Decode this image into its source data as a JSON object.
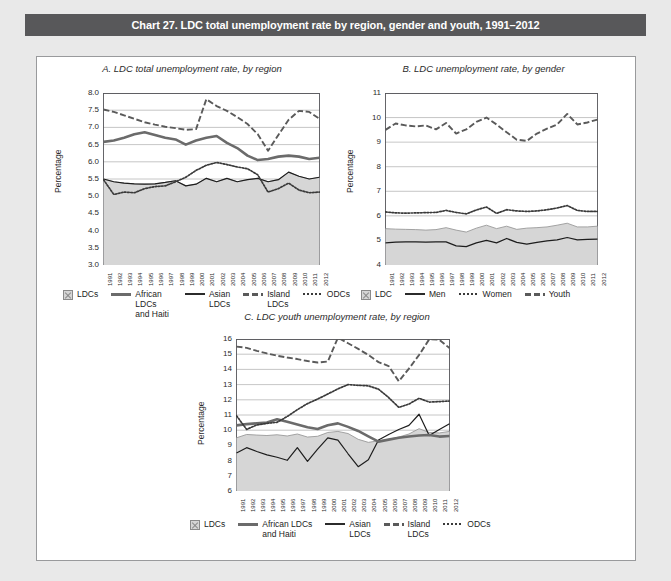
{
  "header": {
    "title": "Chart 27. LDC total unemployment rate by region, gender and youth, 1991–2012",
    "bar_color": "#58585a"
  },
  "page": {
    "background": "#e9e9e9",
    "frame_background": "#ffffff"
  },
  "colors": {
    "area_fill": "#d6d6d6",
    "area_edge": "#9a9a9a",
    "thick_line": "#6b6b6b",
    "thin_line": "#1d1d1d",
    "dashed_line": "#5a5a5a",
    "dotted_line": "#3a3a3a",
    "grid": "#b8b8b8",
    "axis": "#55565a"
  },
  "years": [
    "1991",
    "1992",
    "1993",
    "1994",
    "1995",
    "1996",
    "1997",
    "1998",
    "1999",
    "2000",
    "2001",
    "2002",
    "2003",
    "2004",
    "2005",
    "2006",
    "2007",
    "2008",
    "2009",
    "2010",
    "2011",
    "2012"
  ],
  "panelA": {
    "title": "A.  LDC total unemployment rate, by region",
    "ylabel": "Percentage",
    "yticks": [
      "8.0",
      "7.5",
      "7.0",
      "6.5",
      "6.0",
      "5.5",
      "5.0",
      "4.5",
      "4.0",
      "3.5",
      "3.0"
    ],
    "legend": [
      {
        "name": "LDCs",
        "style": "area"
      },
      {
        "name": "African LDCs and Haiti",
        "style": "thick"
      },
      {
        "name": "Asian LDCs",
        "style": "thin"
      },
      {
        "name": "Island LDCs",
        "style": "dash"
      },
      {
        "name": "ODCs",
        "style": "dot"
      }
    ]
  },
  "panelB": {
    "title": "B.  LDC unemployment rate, by gender",
    "ylabel": "Percentage",
    "yticks": [
      "11",
      "10",
      "9",
      "8",
      "7",
      "6",
      "5",
      "4"
    ],
    "legend": [
      {
        "name": "LDC",
        "style": "area"
      },
      {
        "name": "Men",
        "style": "thin"
      },
      {
        "name": "Women",
        "style": "dot"
      },
      {
        "name": "Youth",
        "style": "dash"
      }
    ]
  },
  "panelC": {
    "title": "C.  LDC youth unemployment rate, by region",
    "ylabel": "Percentage",
    "yticks": [
      "16",
      "15",
      "14",
      "13",
      "12",
      "11",
      "10",
      "9",
      "8",
      "7",
      "6"
    ],
    "legend": [
      {
        "name": "LDCs",
        "style": "area"
      },
      {
        "name": "African LDCs and Haiti",
        "style": "thick"
      },
      {
        "name": "Asian LDCs",
        "style": "thin"
      },
      {
        "name": "Island LDCs",
        "style": "dash"
      },
      {
        "name": "ODCs",
        "style": "dot"
      }
    ]
  },
  "chart_data": [
    {
      "type": "line",
      "panel": "A",
      "title": "A.  LDC total unemployment rate, by region",
      "xlabel": "",
      "ylabel": "Percentage",
      "ylim": [
        3.0,
        8.0
      ],
      "ytick_step": 0.5,
      "grid": true,
      "legend_position": "bottom",
      "x": [
        "1991",
        "1992",
        "1993",
        "1994",
        "1995",
        "1996",
        "1997",
        "1998",
        "1999",
        "2000",
        "2001",
        "2002",
        "2003",
        "2004",
        "2005",
        "2006",
        "2007",
        "2008",
        "2009",
        "2010",
        "2011",
        "2012"
      ],
      "series": [
        {
          "name": "LDCs",
          "style": "area",
          "values": [
            5.5,
            5.42,
            5.38,
            5.36,
            5.35,
            5.36,
            5.4,
            5.45,
            5.3,
            5.35,
            5.52,
            5.42,
            5.52,
            5.42,
            5.48,
            5.52,
            5.42,
            5.48,
            5.7,
            5.58,
            5.5,
            5.55
          ]
        },
        {
          "name": "African LDCs and Haiti",
          "style": "thick",
          "values": [
            6.58,
            6.62,
            6.7,
            6.8,
            6.86,
            6.78,
            6.7,
            6.65,
            6.5,
            6.62,
            6.7,
            6.75,
            6.55,
            6.4,
            6.18,
            6.05,
            6.08,
            6.15,
            6.18,
            6.15,
            6.08,
            6.12
          ]
        },
        {
          "name": "Asian LDCs",
          "style": "thin",
          "values": [
            5.5,
            5.42,
            5.38,
            5.36,
            5.35,
            5.36,
            5.4,
            5.45,
            5.3,
            5.35,
            5.52,
            5.42,
            5.52,
            5.42,
            5.48,
            5.52,
            5.42,
            5.48,
            5.7,
            5.58,
            5.5,
            5.55
          ]
        },
        {
          "name": "Island LDCs",
          "style": "dash",
          "values": [
            7.52,
            7.45,
            7.35,
            7.25,
            7.15,
            7.08,
            7.02,
            6.98,
            6.93,
            6.95,
            7.82,
            7.62,
            7.48,
            7.3,
            7.1,
            6.8,
            6.32,
            6.78,
            7.22,
            7.48,
            7.45,
            7.25
          ]
        },
        {
          "name": "ODCs",
          "style": "dot",
          "values": [
            5.48,
            5.05,
            5.12,
            5.1,
            5.22,
            5.28,
            5.3,
            5.42,
            5.55,
            5.75,
            5.9,
            5.98,
            5.92,
            5.85,
            5.8,
            5.62,
            5.12,
            5.22,
            5.38,
            5.18,
            5.1,
            5.12
          ]
        }
      ]
    },
    {
      "type": "line",
      "panel": "B",
      "title": "B.  LDC unemployment rate, by gender",
      "xlabel": "",
      "ylabel": "Percentage",
      "ylim": [
        4,
        11
      ],
      "ytick_step": 1,
      "grid": true,
      "legend_position": "bottom",
      "x": [
        "1991",
        "1992",
        "1993",
        "1994",
        "1995",
        "1996",
        "1997",
        "1998",
        "1999",
        "2000",
        "2001",
        "2002",
        "2003",
        "2004",
        "2005",
        "2006",
        "2007",
        "2008",
        "2009",
        "2010",
        "2011",
        "2012"
      ],
      "series": [
        {
          "name": "LDC",
          "style": "area",
          "values": [
            5.48,
            5.46,
            5.45,
            5.44,
            5.42,
            5.44,
            5.52,
            5.42,
            5.34,
            5.5,
            5.62,
            5.48,
            5.58,
            5.45,
            5.5,
            5.52,
            5.55,
            5.62,
            5.7,
            5.55,
            5.55,
            5.58
          ]
        },
        {
          "name": "Men",
          "style": "thin",
          "values": [
            4.9,
            4.93,
            4.94,
            4.94,
            4.93,
            4.94,
            4.94,
            4.78,
            4.75,
            4.9,
            5.0,
            4.9,
            5.08,
            4.92,
            4.85,
            4.92,
            4.98,
            5.02,
            5.12,
            5.02,
            5.04,
            5.05
          ]
        },
        {
          "name": "Women",
          "style": "dot",
          "values": [
            6.16,
            6.12,
            6.11,
            6.12,
            6.13,
            6.14,
            6.22,
            6.14,
            6.08,
            6.24,
            6.36,
            6.1,
            6.25,
            6.2,
            6.18,
            6.2,
            6.25,
            6.32,
            6.42,
            6.22,
            6.18,
            6.18
          ]
        },
        {
          "name": "Youth",
          "style": "dash",
          "values": [
            9.5,
            9.76,
            9.68,
            9.64,
            9.68,
            9.52,
            9.78,
            9.35,
            9.52,
            9.82,
            10.0,
            9.72,
            9.4,
            9.1,
            9.05,
            9.35,
            9.55,
            9.72,
            10.15,
            9.72,
            9.8,
            9.92
          ]
        }
      ]
    },
    {
      "type": "line",
      "panel": "C",
      "title": "C.  LDC youth unemployment rate, by region",
      "xlabel": "",
      "ylabel": "Percentage",
      "ylim": [
        6,
        16
      ],
      "ytick_step": 1,
      "grid": true,
      "legend_position": "bottom",
      "x": [
        "1991",
        "1992",
        "1993",
        "1994",
        "1995",
        "1996",
        "1997",
        "1998",
        "1999",
        "2000",
        "2001",
        "2002",
        "2003",
        "2004",
        "2005",
        "2006",
        "2007",
        "2008",
        "2009",
        "2010",
        "2011",
        "2012"
      ],
      "series": [
        {
          "name": "LDCs",
          "style": "area",
          "values": [
            9.5,
            9.72,
            9.68,
            9.65,
            9.7,
            9.62,
            9.75,
            9.55,
            9.6,
            9.85,
            9.92,
            9.78,
            9.4,
            9.2,
            9.3,
            9.4,
            9.55,
            9.75,
            10.1,
            9.85,
            9.82,
            9.92
          ]
        },
        {
          "name": "African LDCs and Haiti",
          "style": "thick",
          "values": [
            10.32,
            10.4,
            10.45,
            10.5,
            10.72,
            10.55,
            10.38,
            10.2,
            10.08,
            10.32,
            10.45,
            10.22,
            9.95,
            9.6,
            9.25,
            9.38,
            9.5,
            9.58,
            9.65,
            9.68,
            9.58,
            9.62
          ]
        },
        {
          "name": "Asian LDCs",
          "style": "thin",
          "values": [
            8.5,
            8.85,
            8.6,
            8.38,
            8.22,
            8.02,
            8.85,
            7.95,
            8.75,
            9.5,
            9.35,
            8.45,
            7.6,
            8.05,
            9.35,
            9.72,
            10.05,
            10.32,
            11.05,
            9.65,
            10.05,
            10.42
          ]
        },
        {
          "name": "Island LDCs",
          "style": "dash",
          "values": [
            15.5,
            15.42,
            15.22,
            15.05,
            14.9,
            14.78,
            14.68,
            14.55,
            14.45,
            14.52,
            16.08,
            15.72,
            15.35,
            14.95,
            14.48,
            14.22,
            13.22,
            14.05,
            14.95,
            15.98,
            15.95,
            15.4
          ]
        },
        {
          "name": "ODCs",
          "style": "dot",
          "values": [
            10.95,
            10.05,
            10.35,
            10.45,
            10.52,
            10.9,
            11.35,
            11.75,
            12.05,
            12.38,
            12.72,
            13.0,
            12.95,
            12.92,
            12.7,
            12.15,
            11.5,
            11.72,
            12.1,
            11.85,
            11.88,
            11.92
          ]
        }
      ]
    }
  ]
}
